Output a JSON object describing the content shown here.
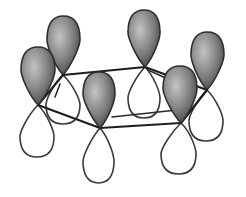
{
  "figure": {
    "orbital_count": 6,
    "colors": {
      "shaded_lobe_light": "#bdbdbd",
      "shaded_lobe_dark": "#4a4a4a",
      "unshaded_lobe": "#ffffff",
      "outline": "#333333",
      "ring_bonds": "#1e1e1e",
      "background": "#ffffff"
    },
    "orbitals": [
      {
        "id": "back-left",
        "node": [
          63,
          75
        ],
        "top_lobe": {
          "cx": 63.5,
          "cy": 45,
          "rx": 16.5,
          "ry": 29
        },
        "bottom_lobe": {
          "cx": 63,
          "cy": 100,
          "rx": 17,
          "ry": 24
        }
      },
      {
        "id": "back-center",
        "node": [
          145,
          67
        ],
        "top_lobe": {
          "cx": 144,
          "cy": 38,
          "rx": 16,
          "ry": 28
        },
        "bottom_lobe": {
          "cx": 144,
          "cy": 93,
          "rx": 16,
          "ry": 25
        }
      },
      {
        "id": "right",
        "node": [
          207,
          90
        ],
        "top_lobe": {
          "cx": 207.5,
          "cy": 61,
          "rx": 16.5,
          "ry": 29
        },
        "bottom_lobe": {
          "cx": 206,
          "cy": 116,
          "rx": 17,
          "ry": 25
        }
      },
      {
        "id": "left",
        "node": [
          38,
          105
        ],
        "top_lobe": {
          "cx": 38,
          "cy": 76,
          "rx": 17,
          "ry": 29
        },
        "bottom_lobe": {
          "cx": 37,
          "cy": 131,
          "rx": 17,
          "ry": 26
        }
      },
      {
        "id": "front-center",
        "node": [
          100,
          128
        ],
        "top_lobe": {
          "cx": 99,
          "cy": 100,
          "rx": 16,
          "ry": 28
        },
        "bottom_lobe": {
          "cx": 98.5,
          "cy": 156,
          "rx": 15.5,
          "ry": 27
        }
      },
      {
        "id": "front-right",
        "node": [
          181,
          123
        ],
        "top_lobe": {
          "cx": 180,
          "cy": 95,
          "rx": 17,
          "ry": 29
        },
        "bottom_lobe": {
          "cx": 178.5,
          "cy": 148,
          "rx": 17.5,
          "ry": 26
        }
      }
    ],
    "ring_edges": [
      {
        "from": "back-left",
        "to": "back-center"
      },
      {
        "from": "back-center",
        "to": "right"
      },
      {
        "from": "right",
        "to": "front-right"
      },
      {
        "from": "front-right",
        "to": "front-center"
      },
      {
        "from": "front-center",
        "to": "left"
      },
      {
        "from": "left",
        "to": "back-left"
      }
    ]
  }
}
